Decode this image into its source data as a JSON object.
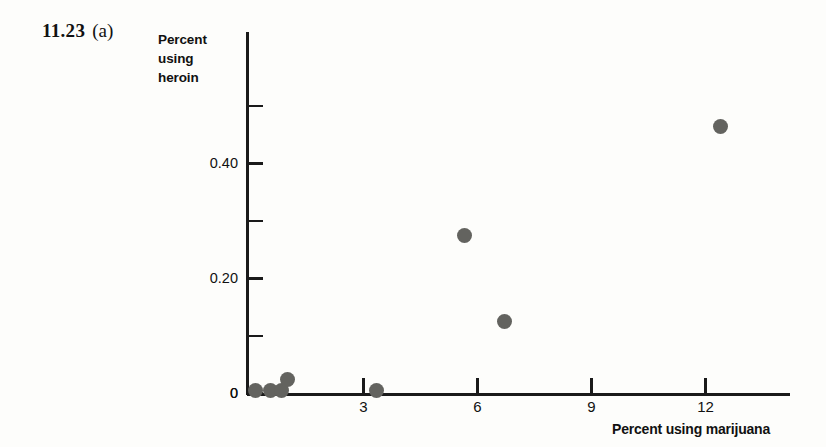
{
  "problem": {
    "number": "11.23",
    "part": "(a)"
  },
  "axes": {
    "ylabel_lines": [
      "Percent",
      "using",
      "heroin"
    ],
    "xlabel": "Percent using marijuana",
    "y_tick_labels": [
      "0",
      "0.20",
      "0.40"
    ],
    "x_tick_labels": [
      "3",
      "6",
      "9",
      "12"
    ]
  },
  "style": {
    "marker_color": "#63635f",
    "axis_color": "#1a1a1a",
    "background": "#fdfdfb",
    "text_color": "#111111"
  },
  "chart_data": {
    "type": "scatter",
    "title": "",
    "subtitle": "",
    "xlabel": "Percent using marijuana",
    "ylabel": "Percent using heroin",
    "xlim": [
      0,
      14.2
    ],
    "ylim": [
      0,
      0.56
    ],
    "xticks": [
      3,
      6,
      9,
      12
    ],
    "yticks": [
      0,
      0.1,
      0.2,
      0.3,
      0.4,
      0.5
    ],
    "ytick_labels_shown": {
      "0": "0",
      "0.2": "0.20",
      "0.4": "0.40"
    },
    "grid": false,
    "legend": false,
    "points": [
      {
        "x": 0.15,
        "y": 0.005
      },
      {
        "x": 0.55,
        "y": 0.005
      },
      {
        "x": 0.85,
        "y": 0.005
      },
      {
        "x": 1.0,
        "y": 0.025
      },
      {
        "x": 3.35,
        "y": 0.005
      },
      {
        "x": 5.65,
        "y": 0.275
      },
      {
        "x": 6.7,
        "y": 0.125
      },
      {
        "x": 12.4,
        "y": 0.465
      }
    ]
  }
}
